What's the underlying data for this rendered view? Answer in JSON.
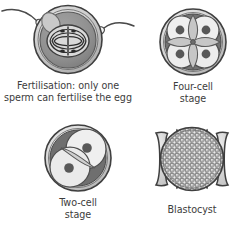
{
  "figure": {
    "background_color": "#ffffff",
    "panels": [
      {
        "id": "fertilisation",
        "icon_name": "fertilised-egg-with-sperm-diagram",
        "caption_lines": [
          "Fertilisation: only one",
          "sperm can fertilise the egg"
        ],
        "parts": {
          "zona_pellucida_label": "zona pellucida",
          "cytoplasm_label": "egg cytoplasm",
          "spindle_label": "meiotic spindle with chromosomes",
          "polar_body_label": "polar body",
          "sperm_count": 2
        }
      },
      {
        "id": "four-cell",
        "icon_name": "four-cell-embryo-diagram",
        "caption_lines": [
          "Four-cell",
          "stage"
        ],
        "parts": {
          "cell_count": 4,
          "nucleus_count": 4
        }
      },
      {
        "id": "two-cell",
        "icon_name": "two-cell-embryo-diagram",
        "caption_lines": [
          "Two-cell",
          "stage"
        ],
        "parts": {
          "cell_count": 2,
          "nucleus_count": 2
        }
      },
      {
        "id": "blastocyst",
        "icon_name": "blastocyst-diagram",
        "caption_lines": [
          "Blastocyst"
        ],
        "parts": {
          "cell_count_appearance": "many small cells",
          "outer_layer_label": "trophoblast"
        }
      }
    ]
  },
  "palette": {
    "outline": "#3f3f3f",
    "membrane_dark": "#4a4a4a",
    "shell_mid": "#b6b6b6",
    "shell_light": "#d8d8d8",
    "cytoplasm_dark": "#8c8c8c",
    "cytoplasm_mid": "#a8a8a8",
    "cell_fill_light": "#efefef",
    "cell_fill_pale": "#e3e3e3",
    "nucleus": "#5e5e5e",
    "wedge_dark": "#6f6f6f",
    "lens_grey": "#c8c8c8",
    "sperm_head": "#f2f2f2",
    "text": "#3c3c3c"
  }
}
